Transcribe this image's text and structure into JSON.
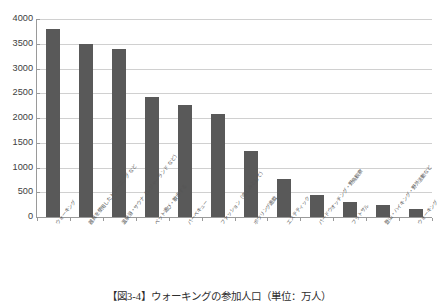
{
  "caption": "【図3-4】ウォーキングの参加人口（単位：万人）",
  "chart_data": {
    "type": "bar",
    "title": "",
    "xlabel": "",
    "ylabel": "",
    "ylim": [
      0,
      4000
    ],
    "ytick_step": 500,
    "grid": true,
    "legend": false,
    "bar_color": "#595959",
    "gridline_color": "#d0d0d0",
    "axis_color": "#9a9a9a",
    "yticks": [
      "0",
      "500",
      "1000",
      "1500",
      "2000",
      "2500",
      "3000",
      "3500",
      "4000"
    ],
    "categories": [
      "ウォーキング",
      "器具を使用したトレーニング など",
      "温泉浴・サウナ（レジャーランド など）",
      "ペット遊び・散歩する",
      "バーベキュー",
      "ファッション（楽しみとして）",
      "ボウリング遊戯",
      "エステティック",
      "バードウオッチング・野鳥観察",
      "フットサル",
      "登山・ハイキング・野外活動など",
      "ウォーキング"
    ],
    "values": [
      3800,
      3500,
      3400,
      2430,
      2270,
      2090,
      1330,
      770,
      450,
      300,
      250,
      160
    ]
  }
}
